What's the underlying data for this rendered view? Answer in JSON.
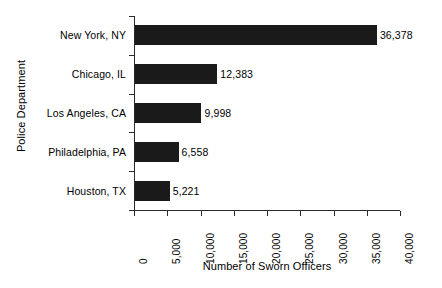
{
  "chart_data": {
    "type": "bar",
    "orientation": "horizontal",
    "title": "",
    "xlabel": "Number of Sworn Officers",
    "ylabel": "Police Department",
    "categories": [
      "New York, NY",
      "Chicago, IL",
      "Los Angeles, CA",
      "Philadelphia, PA",
      "Houston, TX"
    ],
    "values": [
      36378,
      12383,
      9998,
      6558,
      5221
    ],
    "value_labels": [
      "36,378",
      "12,383",
      "9,998",
      "6,558",
      "5,221"
    ],
    "xlim": [
      0,
      40000
    ],
    "xticks": [
      0,
      5000,
      10000,
      15000,
      20000,
      25000,
      30000,
      35000,
      40000
    ],
    "xtick_labels": [
      "0",
      "5,000",
      "10,000",
      "15,000",
      "20,000",
      "25,000",
      "30,000",
      "35,000",
      "40,000"
    ],
    "grid": false,
    "legend": false,
    "bar_color": "#1a1a1a",
    "axis_color": "#2b2b2b",
    "background": "#ffffff"
  }
}
